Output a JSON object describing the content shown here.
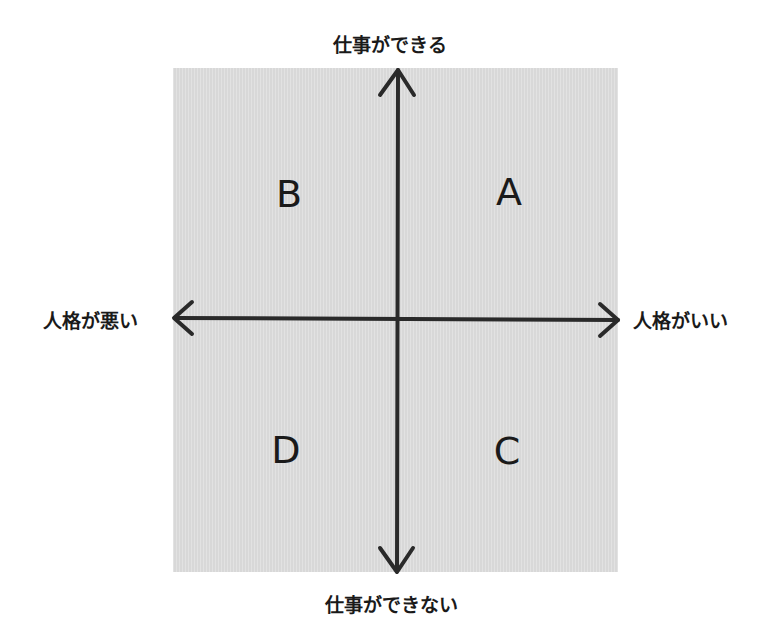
{
  "diagram": {
    "type": "quadrant-matrix",
    "axes": {
      "vertical": {
        "top": "仕事ができる",
        "bottom": "仕事ができない"
      },
      "horizontal": {
        "left": "人格が悪い",
        "right": "人格がいい"
      }
    },
    "quadrants": {
      "top_left": "B",
      "top_right": "A",
      "bottom_left": "D",
      "bottom_right": "C"
    },
    "colors": {
      "panel": "#dcdcdc",
      "ink": "#1a1a1a",
      "background": "#ffffff"
    }
  }
}
